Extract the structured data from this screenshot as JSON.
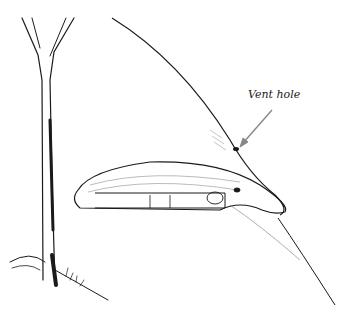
{
  "illustration": {
    "subject": "snow cave shelter on a slope beside a tree",
    "annotations": [
      {
        "label": "Vent hole"
      }
    ],
    "colors": {
      "ink": "#1a1a1a",
      "arrow": "#888888",
      "background": "#ffffff"
    }
  }
}
